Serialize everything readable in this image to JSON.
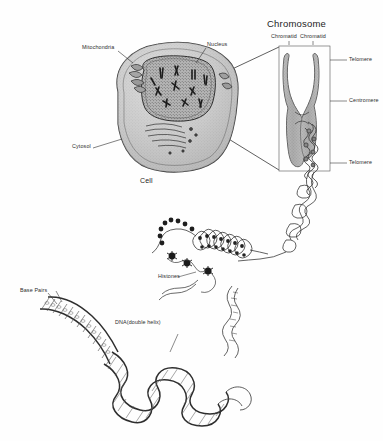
{
  "figure": {
    "title": "Chromosome",
    "background_color": "#fefefe",
    "ink_color": "#2c2c2c"
  },
  "cell_panel": {
    "caption": "Cell",
    "labels": {
      "mitochondria": "Mitochondria",
      "nucleus": "Nucleus",
      "cytosol": "Cytosol"
    }
  },
  "chromosome_panel": {
    "title": "Chromosome",
    "labels": {
      "chromatid_left": "Chromatid",
      "chromatid_right": "Chromatid",
      "telomere_top": "Telomere",
      "centromere": "Centromere",
      "telomere_bottom": "Telomere"
    }
  },
  "chromatin_panel": {
    "labels": {
      "histones": "Histones"
    }
  },
  "dna_panel": {
    "labels": {
      "base_pairs": "Base Pairs",
      "double_helix": "DNA(double helix)"
    }
  }
}
